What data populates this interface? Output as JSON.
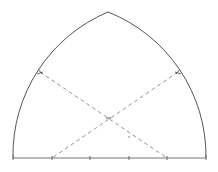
{
  "diagram": {
    "colors": {
      "arc": "#555555",
      "baseline": "#777777",
      "construction": "#8a8a8a"
    },
    "baseline": {
      "x1": 13,
      "x2": 206,
      "y": 158
    },
    "ticks_x": [
      13,
      52,
      90,
      129,
      167,
      206
    ],
    "apex": {
      "x": 108,
      "y": 12
    },
    "left_arc": {
      "from": [
        13,
        158
      ],
      "to": [
        108,
        12
      ],
      "center": [
        167,
        158
      ],
      "radius": 155
    },
    "right_arc": {
      "from": [
        206,
        158
      ],
      "to": [
        108,
        12
      ],
      "center": [
        52,
        158
      ],
      "radius": 155
    },
    "construction_lines": [
      {
        "from": [
          40,
          72
        ],
        "to": [
          167,
          158
        ]
      },
      {
        "from": [
          178,
          72
        ],
        "to": [
          52,
          158
        ]
      }
    ],
    "intersection": {
      "x": 108,
      "y": 118
    },
    "small_dot": {
      "x": 129,
      "y": 137
    }
  }
}
